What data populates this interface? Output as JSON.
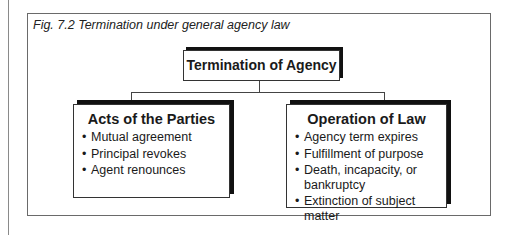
{
  "caption": "Fig. 7.2  Termination under general agency law",
  "root": {
    "label": "Termination of Agency"
  },
  "branches": [
    {
      "title": "Acts of the Parties",
      "items": [
        "Mutual agreement",
        "Principal revokes",
        "Agent renounces"
      ]
    },
    {
      "title": "Operation of Law",
      "items": [
        "Agency term expires",
        "Fulfillment of purpose",
        "Death, incapacity, or bankruptcy",
        "Extinction of subject matter"
      ]
    }
  ],
  "bullet": "•"
}
